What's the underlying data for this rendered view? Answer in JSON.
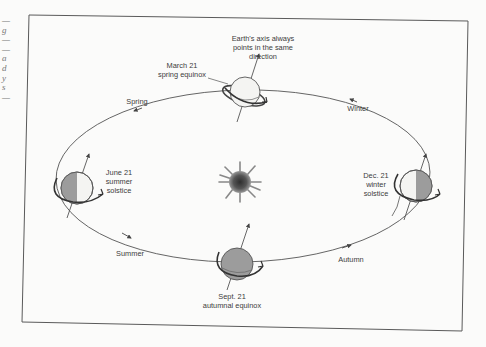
{
  "figure": {
    "sun_label": "Sun",
    "axis_note": [
      "Earth's axis always",
      "points in the same",
      "direction"
    ],
    "positions": [
      {
        "id": "march",
        "date": "March 21",
        "event": "spring equinox"
      },
      {
        "id": "june",
        "date": "June 21",
        "event": "summer",
        "event2": "solstice"
      },
      {
        "id": "sept",
        "date": "Sept. 21",
        "event": "autumnal equinox"
      },
      {
        "id": "dec",
        "date": "Dec. 21",
        "event": "winter",
        "event2": "solstice"
      }
    ],
    "seasons": [
      {
        "id": "spring",
        "label": "Spring"
      },
      {
        "id": "summer",
        "label": "Summer"
      },
      {
        "id": "autumn",
        "label": "Autumn"
      },
      {
        "id": "winter",
        "label": "Winter"
      }
    ],
    "colors": {
      "frame": "#5a5a5a",
      "orbit": "#555555",
      "earth_light": "#f4f4f2",
      "earth_shade": "#9c9c9c",
      "sun_core": "#3a3a3a"
    }
  },
  "margin_fragments": [
    "—",
    "g",
    "—",
    "—",
    "a",
    "d",
    "y",
    "s",
    "—"
  ]
}
